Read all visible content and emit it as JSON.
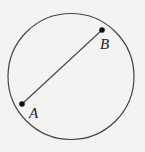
{
  "diagram": {
    "background": "#f3f3f1",
    "stroke_color": "#444444",
    "circle": {
      "cx": 71,
      "cy": 76.5,
      "r": 63
    },
    "chord": {
      "from": "A",
      "to": "B"
    },
    "points": [
      {
        "id": "A",
        "label": "A",
        "x": 22,
        "y": 104,
        "label_x": 29,
        "label_y": 118
      },
      {
        "id": "B",
        "label": "B",
        "x": 102,
        "y": 30,
        "label_x": 100,
        "label_y": 49
      }
    ]
  }
}
